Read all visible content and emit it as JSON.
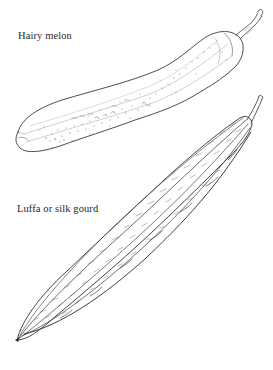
{
  "illustrations": [
    {
      "label": "Hairy melon",
      "icon": "hairy-melon-drawing"
    },
    {
      "label": "Luffa or silk gourd",
      "icon": "luffa-gourd-drawing"
    }
  ],
  "colors": {
    "background": "#ffffff",
    "ink": "#2a2a2a",
    "light_ink": "#8a8a8a"
  }
}
